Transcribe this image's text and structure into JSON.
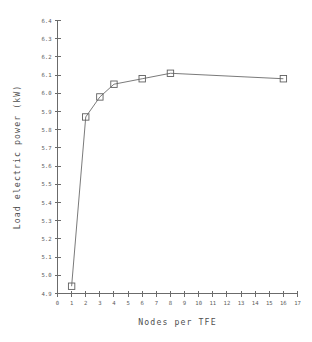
{
  "chart_data": {
    "type": "line",
    "title": "",
    "subtitle": "",
    "xlabel": "Nodes per TFE",
    "ylabel": "Load electric power  (kW)",
    "xlim": [
      0,
      17
    ],
    "ylim": [
      4.9,
      6.4
    ],
    "xticks": [
      0,
      1,
      2,
      3,
      4,
      5,
      6,
      7,
      8,
      9,
      10,
      11,
      12,
      13,
      14,
      15,
      16,
      17
    ],
    "xtick_labels": [
      "0",
      "1",
      "2",
      "3",
      "4",
      "5",
      "6",
      "7",
      "8",
      "9",
      "10",
      "11",
      "12",
      "13",
      "14",
      "15",
      "16",
      "17"
    ],
    "yticks": [
      4.9,
      5.0,
      5.1,
      5.2,
      5.3,
      5.4,
      5.5,
      5.6,
      5.7,
      5.8,
      5.9,
      6.0,
      6.1,
      6.2,
      6.3,
      6.4
    ],
    "ytick_labels": [
      "4.9",
      "5.0",
      "5.1",
      "5.2",
      "5.3",
      "5.4",
      "5.5",
      "5.6",
      "5.7",
      "5.8",
      "5.9",
      "6.0",
      "6.1",
      "6.2",
      "6.3",
      "6.4"
    ],
    "grid": false,
    "legend": null,
    "legend_position": "none",
    "marker": "square-open",
    "line_color": "#6b6b6b",
    "marker_color": "#5f5f5f",
    "background_color": "#ffffff",
    "x": [
      1,
      2,
      3,
      4,
      6,
      8,
      16
    ],
    "values": [
      4.94,
      5.87,
      5.98,
      6.05,
      6.08,
      6.11,
      6.08
    ],
    "series": [
      {
        "name": "Load electric power",
        "x": [
          1,
          2,
          3,
          4,
          6,
          8,
          16
        ],
        "values": [
          4.94,
          5.87,
          5.98,
          6.05,
          6.08,
          6.11,
          6.08
        ]
      }
    ],
    "annotations": []
  }
}
